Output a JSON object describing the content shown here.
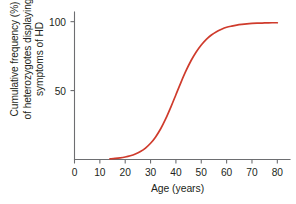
{
  "chart_data": {
    "type": "line",
    "title": "",
    "xlabel": "Age (years)",
    "ylabel": "Cumulative frequency (%) of heterozygotes displaying symptoms of HD",
    "ylabel_lines": [
      "Cumulative frequency (%)",
      "of heterozygotes displaying",
      "symptoms of HD"
    ],
    "xlim": [
      0,
      85
    ],
    "ylim": [
      0,
      107
    ],
    "xticks": [
      0,
      10,
      20,
      30,
      40,
      50,
      60,
      70,
      80
    ],
    "xtick_labels": [
      "0",
      "10",
      "20",
      "30",
      "40",
      "50",
      "60",
      "70",
      "80"
    ],
    "yticks": [
      50,
      100
    ],
    "ytick_labels": [
      "50",
      "100"
    ],
    "grid": false,
    "legend": null,
    "series": [
      {
        "name": "Cumulative frequency of symptomatic heterozygotes",
        "color": "#cf3b2c",
        "x": [
          14,
          16,
          18,
          20,
          22,
          24,
          26,
          28,
          30,
          32,
          34,
          36,
          38,
          40,
          42,
          44,
          46,
          48,
          50,
          52,
          54,
          56,
          58,
          60,
          62,
          64,
          66,
          68,
          70,
          72,
          74,
          76,
          78,
          80
        ],
        "y": [
          0.5,
          0.8,
          1.2,
          1.8,
          2.7,
          4.0,
          5.8,
          8.3,
          11.8,
          16.4,
          22.3,
          29.6,
          38.0,
          47.0,
          56.0,
          64.4,
          71.8,
          78.0,
          83.1,
          87.2,
          90.3,
          92.7,
          94.5,
          95.9,
          96.8,
          97.5,
          98.0,
          98.4,
          98.7,
          98.9,
          99.0,
          99.1,
          99.2,
          99.2
        ]
      }
    ],
    "axis_color": "#6d6e71",
    "curve_color": "#cf3b2c",
    "background": "#ffffff"
  }
}
